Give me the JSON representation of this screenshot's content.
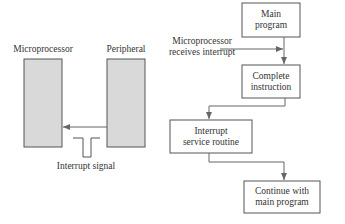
{
  "left_diagram": {
    "microprocessor_label": "Microprocessor",
    "peripheral_label": "Peripheral",
    "signal_label": "Interrupt signal",
    "box_fill": "#d9d9d9",
    "stroke": "#555555"
  },
  "flowchart": {
    "nodes": [
      {
        "id": "main",
        "line1": "Main",
        "line2": "program"
      },
      {
        "id": "complete",
        "line1": "Complete",
        "line2": "instruction"
      },
      {
        "id": "isr",
        "line1": "Interrupt",
        "line2": "service routine"
      },
      {
        "id": "continue",
        "line1": "Continue with",
        "line2": "main program"
      }
    ],
    "annotation": {
      "line1": "Microprocessor",
      "line2": "receives interrupt"
    }
  }
}
